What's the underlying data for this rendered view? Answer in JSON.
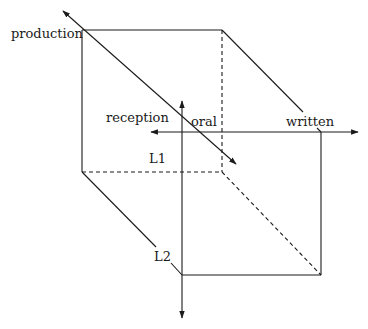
{
  "diagram": {
    "type": "3d-cube-with-axes",
    "labels": {
      "production": "production",
      "reception": "reception",
      "oral": "oral",
      "written": "written",
      "l1": "L1",
      "l2": "L2"
    },
    "axes": [
      {
        "name": "production-reception",
        "from": "reception",
        "to": "production",
        "direction": "diagonal",
        "bidirectional": true
      },
      {
        "name": "oral-written",
        "from": "oral",
        "to": "written",
        "direction": "horizontal",
        "bidirectional": true
      },
      {
        "name": "L1-L2",
        "from": "L1",
        "to": "L2",
        "direction": "vertical",
        "bidirectional": true
      }
    ],
    "colors": {
      "line": "#1a1a1a",
      "background": "#ffffff"
    }
  }
}
